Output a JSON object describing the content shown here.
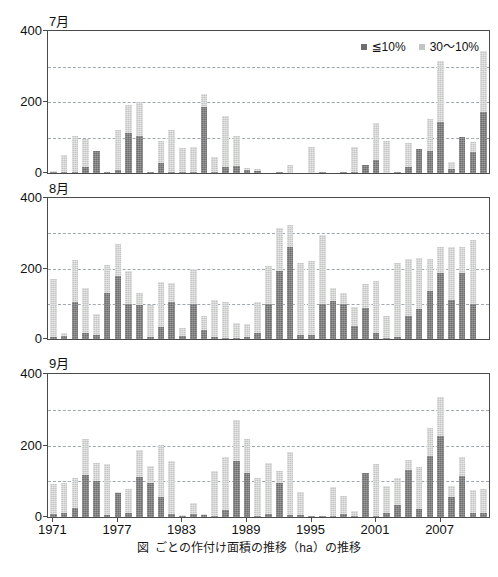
{
  "figure": {
    "caption_figure_label": "図",
    "caption_text": "ごとの作付け面積の推移（ha）の推移",
    "caption_unit_sup": "2"
  },
  "legend": {
    "position": "top-right",
    "items": [
      {
        "label": "≦10%",
        "color": "#6e6e6e",
        "name": "le-10-percent"
      },
      {
        "label": "30〜10%",
        "color": "#c3c5c3",
        "name": "30-to-10-percent"
      }
    ]
  },
  "axis": {
    "y_ticks": [
      "0",
      "200",
      "400"
    ],
    "y_tick_values": [
      0,
      200,
      400
    ],
    "gridline_values": [
      100,
      200,
      300
    ],
    "ylim": [
      0,
      400
    ],
    "x_ticks": [
      "1971",
      "1977",
      "1983",
      "1989",
      "1995",
      "2001",
      "2007"
    ],
    "x_tick_years": [
      1971,
      1977,
      1983,
      1989,
      1995,
      2001,
      2007
    ],
    "xlim": [
      1971,
      2011
    ]
  },
  "chart_data": {
    "type": "bar",
    "stacked": true,
    "title": "",
    "xlabel": "",
    "ylabel": "",
    "ylim": [
      0,
      400
    ],
    "grid": true,
    "legend_position": "top-right",
    "categories": [
      1971,
      1972,
      1973,
      1974,
      1975,
      1976,
      1977,
      1978,
      1979,
      1980,
      1981,
      1982,
      1983,
      1984,
      1985,
      1986,
      1987,
      1988,
      1989,
      1990,
      1991,
      1992,
      1993,
      1994,
      1995,
      1996,
      1997,
      1998,
      1999,
      2000,
      2001,
      2002,
      2003,
      2004,
      2005,
      2006,
      2007,
      2008,
      2009,
      2010,
      2011
    ],
    "panels": [
      {
        "name": "july",
        "label": "7月",
        "series": [
          {
            "name": "≦10%",
            "color": "#6e6e6e",
            "values": [
              4,
              2,
              4,
              18,
              62,
              2,
              8,
              113,
              103,
              2,
              28,
              2,
              2,
              4,
              186,
              4,
              18,
              20,
              8,
              6,
              0,
              2,
              0,
              0,
              0,
              2,
              0,
              2,
              4,
              22,
              38,
              0,
              4,
              18,
              68,
              62,
              145,
              10,
              102,
              58,
              173,
              82
            ]
          },
          {
            "name": "30〜10%",
            "color": "#c3c5c3",
            "values": [
              2,
              50,
              101,
              78,
              0,
              0,
              112,
              78,
              97,
              0,
              62,
              118,
              68,
              68,
              38,
              40,
              142,
              84,
              6,
              6,
              0,
              2,
              22,
              0,
              72,
              0,
              0,
              0,
              70,
              0,
              104,
              90,
              0,
              68,
              0,
              90,
              170,
              22,
              0,
              30,
              170,
              90,
              0
            ]
          }
        ]
      },
      {
        "name": "august",
        "label": "8月",
        "series": [
          {
            "name": "≦10%",
            "color": "#6e6e6e",
            "values": [
              6,
              8,
              106,
              18,
              10,
              130,
              178,
              100,
              96,
              6,
              34,
              106,
              8,
              100,
              26,
              6,
              4,
              2,
              6,
              18,
              98,
              192,
              262,
              10,
              10,
              98,
              108,
              98,
              38,
              88,
              16,
              4,
              6,
              66,
              86,
              136,
              188,
              112,
              186,
              98,
              0
            ]
          },
          {
            "name": "30〜10%",
            "color": "#c3c5c3",
            "values": [
              164,
              10,
              118,
              126,
              62,
              80,
              92,
              94,
              34,
              90,
              128,
              54,
              24,
              98,
              40,
              106,
              100,
              44,
              38,
              86,
              108,
              122,
              62,
              206,
              212,
              196,
              38,
              32,
              54,
              68,
              150,
              62,
              210,
              160,
              144,
              90,
              72,
              148,
              74,
              184,
              0
            ]
          }
        ]
      },
      {
        "name": "september",
        "label": "9月",
        "series": [
          {
            "name": "≦10%",
            "color": "#6e6e6e",
            "values": [
              8,
              10,
              24,
              118,
              102,
              6,
              68,
              12,
              112,
              96,
              56,
              8,
              4,
              8,
              6,
              4,
              20,
              158,
              122,
              4,
              8,
              96,
              6,
              6,
              2,
              4,
              4,
              8,
              4,
              122,
              4,
              10,
              34,
              132,
              22,
              172,
              226,
              56,
              116,
              10,
              12
            ]
          },
          {
            "name": "30〜10%",
            "color": "#c3c5c3",
            "values": [
              84,
              84,
              86,
              100,
              48,
              142,
              2,
              66,
              76,
              48,
              146,
              150,
              2,
              30,
              2,
              124,
              148,
              114,
              96,
              106,
              144,
              34,
              176,
              64,
              0,
              0,
              80,
              50,
              12,
              0,
              144,
              78,
              74,
              28,
              118,
              78,
              110,
              32,
              52,
              66,
              66
            ]
          }
        ]
      }
    ]
  }
}
